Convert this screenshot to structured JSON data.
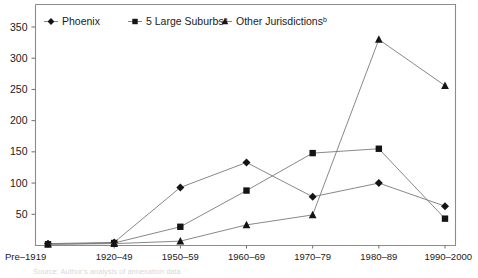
{
  "chart_data": {
    "type": "line",
    "title": "",
    "xlabel": "",
    "ylabel": "",
    "ylim": [
      0,
      350
    ],
    "ytick_step": 50,
    "grid": false,
    "legend_position": "top-inside",
    "categories": [
      "Pre–1919",
      "1920–49",
      "1950–59",
      "1960–69",
      "1970–79",
      "1980–89",
      "1990–2000"
    ],
    "yticks": [
      "50",
      "100",
      "150",
      "200",
      "250",
      "300",
      "350"
    ],
    "ytick_values": [
      50,
      100,
      150,
      200,
      250,
      300,
      350
    ],
    "series": [
      {
        "name": "Phoenix",
        "marker": "diamond",
        "values": [
          3,
          5,
          93,
          133,
          78,
          100,
          63
        ]
      },
      {
        "name": "5 Large Suburbs",
        "name_superscript": "a",
        "marker": "square",
        "values": [
          2,
          4,
          30,
          88,
          148,
          155,
          43
        ]
      },
      {
        "name": "Other Jurisdictions",
        "name_superscript": "b",
        "marker": "triangle",
        "values": [
          2,
          3,
          7,
          33,
          49,
          330,
          256
        ]
      }
    ]
  },
  "legend": {
    "items": [
      {
        "label": "Phoenix",
        "superscript": "",
        "marker": "diamond-marker-icon"
      },
      {
        "label": "5 Large Suburbs",
        "superscript": "a",
        "marker": "square-marker-icon"
      },
      {
        "label": "Other Jurisdictions",
        "superscript": "b",
        "marker": "triangle-marker-icon"
      }
    ]
  },
  "footnote": {
    "text": "Source: Author's analysis of annexation data"
  },
  "colors": {
    "line": "#7a7a7a",
    "marker": "#141414",
    "frame": "#8c8c8c",
    "text": "#1a1a1a",
    "background": "#ffffff"
  }
}
